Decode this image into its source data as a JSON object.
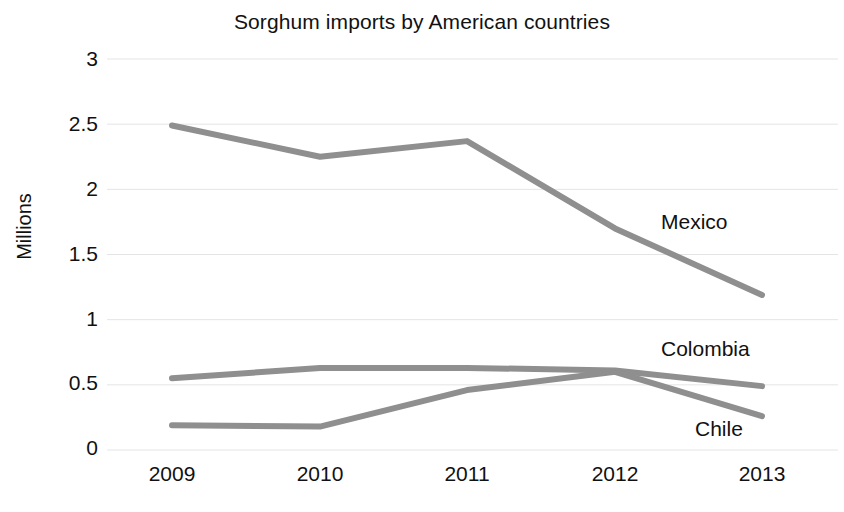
{
  "chart_data": {
    "type": "line",
    "title": "Sorghum imports by American countries",
    "xlabel": "",
    "ylabel": "Millions",
    "categories": [
      "2009",
      "2010",
      "2011",
      "2012",
      "2013"
    ],
    "x": [
      2009,
      2010,
      2011,
      2012,
      2013
    ],
    "series": [
      {
        "name": "Mexico",
        "values": [
          2.49,
          2.25,
          2.37,
          1.7,
          1.19
        ],
        "color": "#8f8f8f"
      },
      {
        "name": "Colombia",
        "values": [
          0.55,
          0.63,
          0.63,
          0.61,
          0.49
        ],
        "color": "#8f8f8f"
      },
      {
        "name": "Chile",
        "values": [
          0.19,
          0.18,
          0.46,
          0.6,
          0.26
        ],
        "color": "#8f8f8f"
      }
    ],
    "ylim": [
      0,
      3
    ],
    "yticks": [
      0,
      0.5,
      1,
      1.5,
      2,
      2.5,
      3
    ],
    "ytick_labels": [
      "0",
      "0.5",
      "1",
      "1.5",
      "2",
      "2.5",
      "3"
    ],
    "grid": true,
    "grid_color": "#e4e4e4",
    "legend": "series-end-labels",
    "background": "#ffffff"
  },
  "labels": {
    "y_ticks": [
      "3",
      "2.5",
      "2",
      "1.5",
      "1",
      "0.5",
      "0"
    ],
    "x_ticks": [
      "2009",
      "2010",
      "2011",
      "2012",
      "2013"
    ],
    "series_names": [
      "Mexico",
      "Colombia",
      "Chile"
    ]
  }
}
